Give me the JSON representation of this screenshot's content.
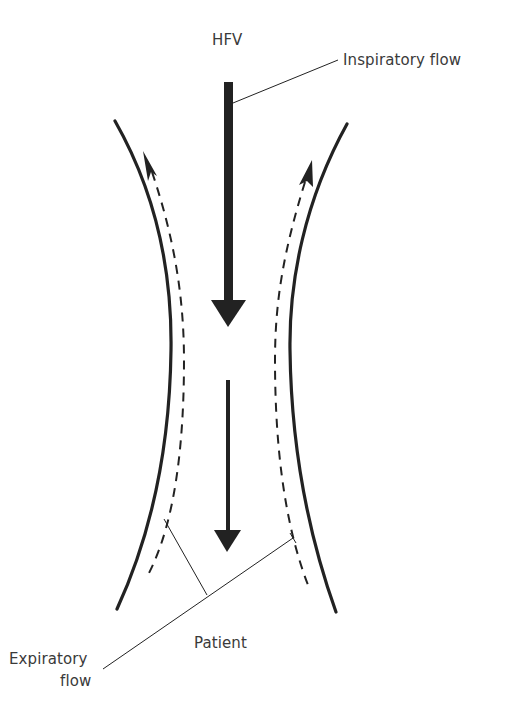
{
  "diagram": {
    "type": "airway-flow-schematic",
    "labels": {
      "top": "HFV",
      "inspiratory": "Inspiratory flow",
      "expiratory_line1": "Expiratory",
      "expiratory_line2": "flow",
      "bottom": "Patient"
    },
    "elements": {
      "airway_walls": "curved hourglass-shaped tube walls",
      "inspiratory_arrows": "two solid downward arrows along center",
      "expiratory_arrows": "two dashed upward arrows along walls"
    },
    "colors": {
      "line": "#222222",
      "text": "#3a3a3a",
      "background": "#ffffff"
    }
  }
}
